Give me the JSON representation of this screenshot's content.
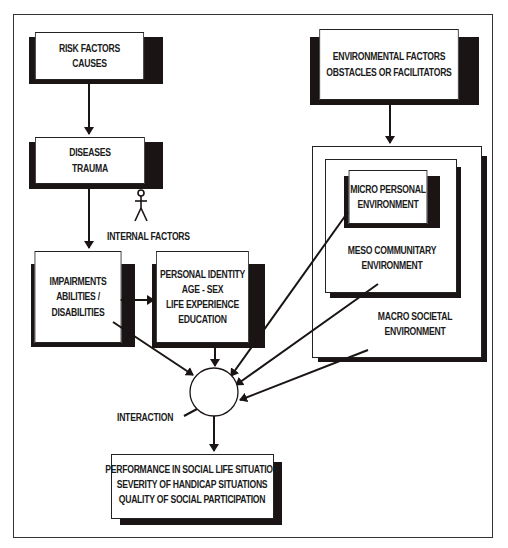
{
  "diagram": {
    "nodes": {
      "risk_factors": {
        "lines": [
          "RISK FACTORS",
          "CAUSES"
        ]
      },
      "diseases": {
        "lines": [
          "DISEASES",
          "TRAUMA"
        ]
      },
      "environmental_factors": {
        "lines": [
          "ENVIRONMENTAL FACTORS",
          "OBSTACLES OR FACILITATORS"
        ]
      },
      "micro": {
        "lines": [
          "MICRO PERSONAL",
          "ENVIRONMENT"
        ]
      },
      "meso": {
        "lines": [
          "MESO COMMUNITARY",
          "ENVIRONMENT"
        ]
      },
      "macro": {
        "lines": [
          "MACRO SOCIETAL",
          "ENVIRONMENT"
        ]
      },
      "impairments": {
        "lines": [
          "IMPAIRMENTS",
          "ABILITIES /",
          "DISABILITIES"
        ]
      },
      "personal_identity": {
        "lines": [
          "PERSONAL IDENTITY",
          "AGE - SEX",
          "LIFE EXPERIENCE",
          "EDUCATION"
        ]
      },
      "outcome": {
        "lines": [
          "PERFORMANCE IN SOCIAL LIFE SITUATION",
          "SEVERITY OF HANDICAP SITUATIONS",
          "QUALITY OF SOCIAL PARTICIPATION"
        ]
      }
    },
    "labels": {
      "internal_factors": "INTERNAL FACTORS",
      "interaction": "INTERACTION"
    },
    "icons": {
      "person": "stick-figure-icon"
    },
    "edges": [
      {
        "from": "risk_factors",
        "to": "diseases"
      },
      {
        "from": "diseases",
        "to": "impairments"
      },
      {
        "from": "environmental_factors",
        "to": "macro"
      },
      {
        "from": "impairments",
        "to": "personal_identity",
        "bidirectional": true
      },
      {
        "from": "impairments",
        "to": "interaction"
      },
      {
        "from": "personal_identity",
        "to": "interaction"
      },
      {
        "from": "micro",
        "to": "interaction"
      },
      {
        "from": "meso",
        "to": "interaction"
      },
      {
        "from": "macro",
        "to": "interaction"
      },
      {
        "from": "interaction",
        "to": "outcome"
      }
    ]
  }
}
